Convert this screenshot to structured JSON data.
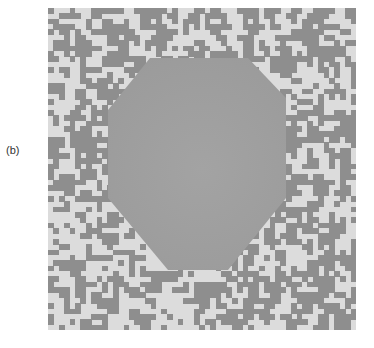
{
  "figure": {
    "panel_label": "(b)",
    "grid": {
      "cols": 57,
      "rows": 60,
      "seed": 1337,
      "dark_fraction": 0.5,
      "colors": {
        "light": "#dcdcdc",
        "dark": "#8e8e8e",
        "hexagon_fill": "#9b9b9b"
      }
    },
    "hexagon_vertices_px": [
      [
        102,
        50
      ],
      [
        200,
        50
      ],
      [
        238,
        90
      ],
      [
        238,
        190
      ],
      [
        180,
        262
      ],
      [
        120,
        262
      ],
      [
        60,
        190
      ],
      [
        60,
        102
      ]
    ]
  }
}
